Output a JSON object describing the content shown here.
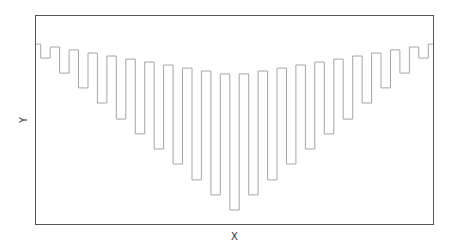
{
  "chart_data": {
    "type": "line",
    "style": "step",
    "title": "",
    "xlabel": "X",
    "ylabel": "Y",
    "xticks": [],
    "yticks": [],
    "grid": false,
    "legend": null,
    "xlim": [
      0,
      42
    ],
    "ylim": [
      0,
      100
    ],
    "x": [
      0,
      1,
      2,
      3,
      4,
      5,
      6,
      7,
      8,
      9,
      10,
      11,
      12,
      13,
      14,
      15,
      16,
      17,
      18,
      19,
      20,
      21,
      22,
      23,
      24,
      25,
      26,
      27,
      28,
      29,
      30,
      31,
      32,
      33,
      34,
      35,
      36,
      37,
      38,
      39,
      40,
      41,
      42
    ],
    "series": [
      {
        "name": "series",
        "color": "#a6a6a6",
        "values": [
          86.1,
          79.4,
          84.7,
          72.2,
          83.3,
          65.1,
          81.8,
          57.9,
          80.4,
          50.2,
          78.9,
          43.1,
          77.5,
          35.9,
          76.1,
          28.7,
          74.6,
          21.1,
          73.2,
          13.9,
          71.8,
          6.7,
          71.8,
          13.9,
          73.2,
          21.1,
          74.6,
          28.7,
          76.1,
          35.9,
          77.5,
          43.1,
          78.9,
          50.2,
          80.4,
          57.9,
          81.8,
          65.1,
          83.3,
          72.2,
          84.7,
          79.4,
          86.1
        ]
      }
    ]
  },
  "colors": {
    "frame": "#555555",
    "line": "#a6a6a6",
    "label": "#333333"
  }
}
